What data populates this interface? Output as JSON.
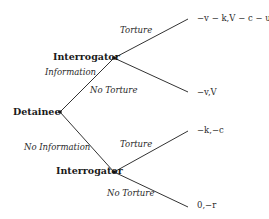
{
  "diagram": {
    "type": "extensive-form game tree",
    "nodes": {
      "root": {
        "label": "Detainee"
      },
      "upper": {
        "label": "Interrogator"
      },
      "lower": {
        "label": "Interrogator"
      }
    },
    "actions": {
      "root_up": "Information",
      "root_down": "No Information",
      "upper_up": "Torture",
      "upper_down": "No Torture",
      "lower_up": "Torture",
      "lower_down": "No Torture"
    },
    "payoffs": {
      "info_torture": "−v − k,V − c − u",
      "info_no_torture": "−v,V",
      "noinfo_torture": "−k,−c",
      "noinfo_no_torture": "0,−r"
    },
    "colors": {
      "line": "#333333",
      "node": "#111111",
      "text": "#1a1a1a"
    }
  }
}
